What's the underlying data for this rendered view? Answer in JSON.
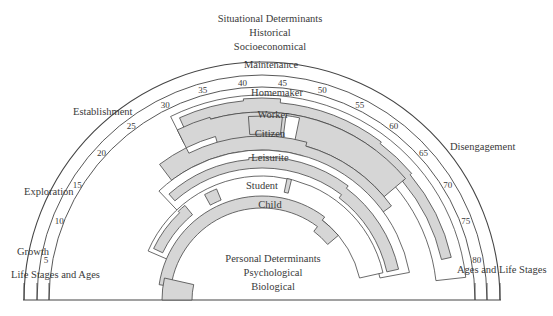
{
  "title": {
    "situational": [
      "Situational Determinants",
      "Historical",
      "Socioeconomical"
    ],
    "personal": [
      "Personal Determinants",
      "Psychological",
      "Biological"
    ]
  },
  "stages": {
    "growth": "Growth",
    "exploration": "Exploration",
    "establishment": "Establishment",
    "maintenance": "Maintenance",
    "disengagement": "Disengagement"
  },
  "axis_labels": {
    "left": "Life Stages and Ages",
    "right": "Ages and Life Stages"
  },
  "ages": [
    "5",
    "10",
    "15",
    "20",
    "25",
    "30",
    "35",
    "40",
    "45",
    "50",
    "55",
    "60",
    "65",
    "70",
    "75",
    "80"
  ],
  "roles": [
    "Homemaker",
    "Worker",
    "Citizen",
    "Leisurite",
    "Student",
    "Child"
  ],
  "colors": {
    "fill": "#d6d6d6",
    "line": "#454545",
    "text": "#3a3a3a"
  }
}
